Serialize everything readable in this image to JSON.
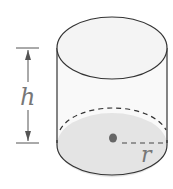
{
  "diagram": {
    "type": "cylinder",
    "labels": {
      "height": "h",
      "radius": "r"
    },
    "colors": {
      "outline": "#333333",
      "base_fill": "#e3e3e3",
      "body_fill": "#f7f7f7",
      "center_dot": "#666666",
      "label": "#777777"
    }
  }
}
